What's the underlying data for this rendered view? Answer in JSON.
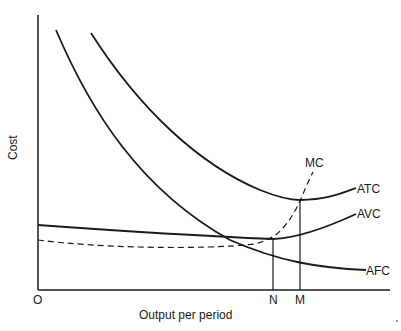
{
  "diagram": {
    "y_axis_label": "Cost",
    "x_axis_label": "Output per period",
    "origin_label": "O",
    "x_markers": [
      {
        "label": "N",
        "meaning": "output at minimum AVC (MC = AVC)"
      },
      {
        "label": "M",
        "meaning": "output at minimum ATC (MC = ATC)"
      }
    ],
    "curves": [
      {
        "label": "ATC",
        "style": "solid"
      },
      {
        "label": "AVC",
        "style": "solid"
      },
      {
        "label": "AFC",
        "style": "solid"
      },
      {
        "label": "MC",
        "style": "dashed"
      }
    ],
    "colors": {
      "ink": "#1a1a1a",
      "background": "#ffffff"
    }
  }
}
